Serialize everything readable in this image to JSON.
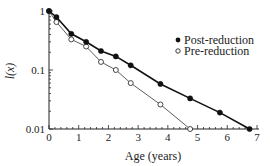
{
  "chart_data": {
    "type": "line",
    "title": "",
    "xlabel": "Age (years)",
    "ylabel": "l(x)",
    "yscale": "log",
    "xlim": [
      0,
      7
    ],
    "ylim": [
      0.01,
      1
    ],
    "xticks": [
      0,
      1,
      2,
      3,
      4,
      5,
      6,
      7
    ],
    "yticks": [
      {
        "value": 1,
        "label": "1"
      },
      {
        "value": 0.1,
        "label": "0.1"
      },
      {
        "value": 0.01,
        "label": "0.01"
      }
    ],
    "grid": false,
    "legend_position": "upper right",
    "series": [
      {
        "name": "Post-reduction",
        "marker": "filled-circle",
        "color": "#111111",
        "line_width": 1.6,
        "x": [
          0,
          0.25,
          0.75,
          1.25,
          1.75,
          2.25,
          2.75,
          3.75,
          4.75,
          5.75,
          6.75
        ],
        "values": [
          1.0,
          0.79,
          0.41,
          0.3,
          0.21,
          0.17,
          0.12,
          0.058,
          0.033,
          0.019,
          0.01
        ]
      },
      {
        "name": "Pre-reduction",
        "marker": "open-circle",
        "color": "#333333",
        "line_width": 0.8,
        "x": [
          0,
          0.25,
          0.75,
          1.25,
          1.75,
          2.25,
          2.75,
          3.75,
          4.75
        ],
        "values": [
          1.0,
          0.65,
          0.33,
          0.25,
          0.137,
          0.1,
          0.06,
          0.026,
          0.01
        ]
      }
    ]
  },
  "legend": {
    "items": [
      {
        "label": "Post-reduction",
        "marker": "filled-circle"
      },
      {
        "label": "Pre-reduction",
        "marker": "open-circle"
      }
    ]
  }
}
